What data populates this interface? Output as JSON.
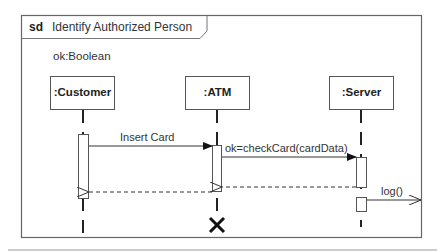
{
  "frame": {
    "keyword": "sd",
    "title": "Identify Authorized Person"
  },
  "local_attribute": "ok:Boolean",
  "lifelines": [
    {
      "name": ":Customer",
      "x": 83
    },
    {
      "name": ":ATM",
      "x": 217
    },
    {
      "name": ":Server",
      "x": 361
    }
  ],
  "messages": [
    {
      "label": "Insert Card",
      "from": ":Customer",
      "to": ":ATM",
      "type": "synchronous"
    },
    {
      "label": "ok=checkCard(cardData)",
      "from": ":ATM",
      "to": ":Server",
      "type": "synchronous"
    },
    {
      "label": "",
      "from": ":Server",
      "to": ":ATM",
      "type": "reply"
    },
    {
      "label": "",
      "from": ":ATM",
      "to": ":Customer",
      "type": "reply"
    },
    {
      "label": "log()",
      "from": ":Server",
      "to": "gate",
      "type": "asynchronous"
    }
  ],
  "destruction": {
    "lifeline": ":ATM",
    "symbol": "X"
  },
  "colors": {
    "line": "#333333",
    "frame": "#666666",
    "background": "#ffffff"
  }
}
